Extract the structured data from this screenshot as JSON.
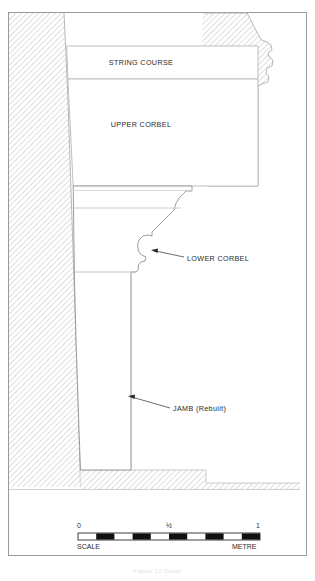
{
  "drawing": {
    "title_caption": "Figure 12  Detail",
    "frame": {
      "color": "#9a9a9a"
    },
    "colors": {
      "hatch_line": "#c9c9c9",
      "hatch_bg": "#ffffff",
      "outline": "#8d8d8d",
      "stone_line": "#b4b4b4",
      "text": "#2a2a2a",
      "leader": "#3a3a3a",
      "scale_fill": "#111111"
    },
    "labels": [
      {
        "id": "string-course",
        "text": "STRING COURSE",
        "x": 141,
        "y": 62
      },
      {
        "id": "upper-corbel",
        "text": "UPPER CORBEL",
        "x": 141,
        "y": 124
      },
      {
        "id": "lower-corbel",
        "text": "LOWER CORBEL",
        "x": 187,
        "y": 259
      },
      {
        "id": "jamb-rebuilt",
        "text": "JAMB (Rebuilt)",
        "x": 173,
        "y": 409
      }
    ],
    "leaders": [
      {
        "id": "lower-corbel-leader",
        "x1": 184,
        "y1": 257,
        "x2": 152,
        "y2": 250
      },
      {
        "id": "jamb-leader",
        "x1": 170,
        "y1": 408,
        "x2": 128,
        "y2": 396
      }
    ]
  },
  "scale_bar": {
    "label_left": "SCALE",
    "label_right": "METRE",
    "tick_start": "0",
    "tick_mid": "½",
    "tick_end": "1",
    "segments": 10,
    "x": 78,
    "y": 533,
    "width": 182,
    "height": 7
  }
}
